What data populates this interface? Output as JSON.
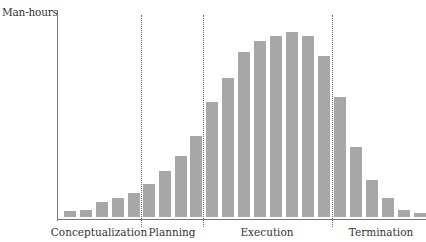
{
  "chart_data": {
    "type": "bar",
    "title": "",
    "xlabel": "",
    "ylabel": "Man-hours",
    "ylim": [
      0,
      100
    ],
    "grid": false,
    "legend": null,
    "categories": [
      "1",
      "2",
      "3",
      "4",
      "5",
      "6",
      "7",
      "8",
      "9",
      "10",
      "11",
      "12",
      "13",
      "14",
      "15",
      "16",
      "17",
      "18",
      "19",
      "20",
      "21",
      "22",
      "23"
    ],
    "values": [
      3,
      4,
      8,
      10,
      13,
      18,
      25,
      33,
      44,
      62,
      75,
      89,
      95,
      98,
      100,
      98,
      87,
      65,
      38,
      20,
      10,
      4,
      2
    ],
    "phases": [
      {
        "label": "Conceptualization",
        "bars": [
          1,
          5
        ]
      },
      {
        "label": "Planning",
        "bars": [
          6,
          9
        ]
      },
      {
        "label": "Execution",
        "bars": [
          10,
          17
        ]
      },
      {
        "label": "Termination",
        "bars": [
          18,
          23
        ]
      }
    ],
    "annotations": [
      "Phase boundaries shown as dotted vertical lines"
    ]
  },
  "labels": {
    "ylabel": "Man-hours",
    "phase0": "Conceptualization",
    "phase1": "Planning",
    "phase2": "Execution",
    "phase3": "Termination"
  },
  "colors": {
    "bar": "#a7a7a7",
    "axis": "#777777"
  }
}
